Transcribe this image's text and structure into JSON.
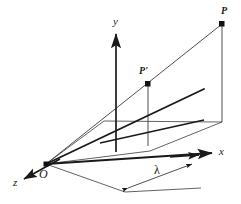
{
  "figure": {
    "kind": "3d-coordinate-diagram",
    "background_color": "#ffffff",
    "stroke_color": "#1a1a1a",
    "thin_stroke_color": "#3a3a3a",
    "width": 241,
    "height": 204,
    "axes": [
      {
        "id": "y",
        "label": "y",
        "label_x": 113,
        "label_y": 18,
        "arrow": true
      },
      {
        "id": "x",
        "label": "x",
        "label_x": 219,
        "label_y": 147,
        "arrow": true
      },
      {
        "id": "z",
        "label": "z",
        "label_x": 13,
        "label_y": 179,
        "arrow": true
      }
    ],
    "points": [
      {
        "id": "P",
        "label": "P",
        "x": 222,
        "y": 24,
        "label_x": 222,
        "label_y": 8,
        "dot": true
      },
      {
        "id": "Pprime",
        "label": "P'",
        "x": 148,
        "y": 84,
        "label_x": 140,
        "label_y": 68,
        "dot": true
      },
      {
        "id": "O",
        "label": "O",
        "x": 46,
        "y": 164,
        "label_x": 40,
        "label_y": 170,
        "dot": true
      }
    ],
    "measurements": [
      {
        "id": "lambda",
        "label": "λ",
        "label_x": 155,
        "label_y": 166,
        "arrow_start_x": 126,
        "arrow_start_y": 189,
        "arrow_end_x": 194,
        "arrow_end_y": 163
      }
    ],
    "geometry": {
      "origin": {
        "x": 46,
        "y": 164
      },
      "y_axis_top": {
        "x": 116,
        "y": 33
      },
      "y_axis_bottom": {
        "x": 116,
        "y": 152
      },
      "y_axis_plane_cross": {
        "x": 116,
        "y": 133
      },
      "x_axis_end": {
        "x": 213,
        "y": 153
      },
      "z_axis_end": {
        "x": 23,
        "y": 180
      },
      "P_base": {
        "x": 222,
        "y": 122
      },
      "Pprime_base": {
        "x": 148,
        "y": 145
      },
      "bold_ray_end": {
        "x": 204,
        "y": 89
      },
      "plane_back_left": {
        "x": 104,
        "y": 121
      },
      "plane_right": {
        "x": 222,
        "y": 122
      },
      "plane_front": {
        "x": 150,
        "y": 151
      }
    }
  }
}
